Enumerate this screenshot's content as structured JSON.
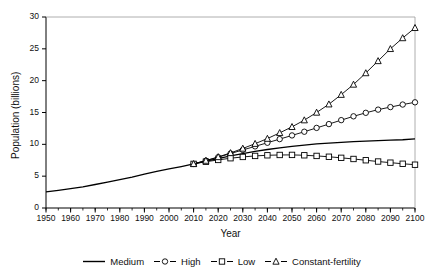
{
  "chart_data": {
    "type": "line",
    "title": "",
    "xlabel": "Year",
    "ylabel": "Population (billions)",
    "xlim": [
      1950,
      2100
    ],
    "ylim": [
      0,
      30
    ],
    "xticks": [
      1950,
      1960,
      1970,
      1980,
      1990,
      2000,
      2010,
      2020,
      2030,
      2040,
      2050,
      2060,
      2070,
      2080,
      2090,
      2100
    ],
    "yticks": [
      0,
      5,
      10,
      15,
      20,
      25,
      30
    ],
    "minor_xtick_step": 5,
    "grid": false,
    "legend_position": "bottom",
    "series": [
      {
        "name": "Medium",
        "marker": "none",
        "color": "#000000",
        "x": [
          1950,
          1955,
          1960,
          1965,
          1970,
          1975,
          1980,
          1985,
          1990,
          1995,
          2000,
          2005,
          2010,
          2015,
          2020,
          2025,
          2030,
          2035,
          2040,
          2045,
          2050,
          2055,
          2060,
          2065,
          2070,
          2075,
          2080,
          2085,
          2090,
          2095,
          2100
        ],
        "values": [
          2.53,
          2.77,
          3.03,
          3.33,
          3.69,
          4.07,
          4.45,
          4.86,
          5.32,
          5.74,
          6.13,
          6.51,
          6.93,
          7.35,
          7.76,
          8.18,
          8.55,
          8.89,
          9.19,
          9.45,
          9.69,
          9.89,
          10.06,
          10.2,
          10.32,
          10.43,
          10.51,
          10.58,
          10.65,
          10.72,
          10.85
        ]
      },
      {
        "name": "High",
        "marker": "circle",
        "color": "#000000",
        "x": [
          2010,
          2015,
          2020,
          2025,
          2030,
          2035,
          2040,
          2045,
          2050,
          2055,
          2060,
          2065,
          2070,
          2075,
          2080,
          2085,
          2090,
          2095,
          2100
        ],
        "values": [
          6.93,
          7.43,
          7.98,
          8.55,
          9.12,
          9.68,
          10.25,
          10.82,
          11.4,
          11.98,
          12.58,
          13.18,
          13.8,
          14.4,
          14.95,
          15.45,
          15.85,
          16.25,
          16.6
        ]
      },
      {
        "name": "Low",
        "marker": "square",
        "color": "#000000",
        "x": [
          2010,
          2015,
          2020,
          2025,
          2030,
          2035,
          2040,
          2045,
          2050,
          2055,
          2060,
          2065,
          2070,
          2075,
          2080,
          2085,
          2090,
          2095,
          2100
        ],
        "values": [
          6.93,
          7.27,
          7.55,
          7.82,
          8.02,
          8.18,
          8.28,
          8.33,
          8.34,
          8.28,
          8.18,
          8.05,
          7.88,
          7.7,
          7.5,
          7.3,
          7.12,
          6.95,
          6.8
        ]
      },
      {
        "name": "Constant-fertility",
        "marker": "triangle",
        "color": "#000000",
        "x": [
          2010,
          2015,
          2020,
          2025,
          2030,
          2035,
          2040,
          2045,
          2050,
          2055,
          2060,
          2065,
          2070,
          2075,
          2080,
          2085,
          2090,
          2095,
          2100
        ],
        "values": [
          6.93,
          7.45,
          8.02,
          8.65,
          9.35,
          10.1,
          10.9,
          11.8,
          12.75,
          13.8,
          15.0,
          16.3,
          17.8,
          19.4,
          21.2,
          23.1,
          25.0,
          26.7,
          28.3
        ]
      }
    ]
  }
}
